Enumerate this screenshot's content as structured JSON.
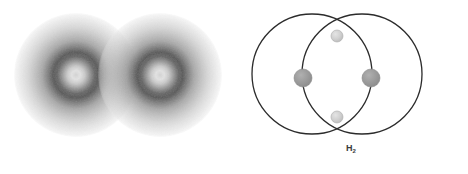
{
  "figure": {
    "width": 468,
    "height": 174,
    "background_color": "#ffffff",
    "caption_label": "H",
    "caption_subscript": "2",
    "caption_full": "H2"
  },
  "panels": [
    {
      "id": "electron-density",
      "name": "electron-density-cloud-panel",
      "description": "Two overlapping spherical electron density clouds",
      "rendering": "grayscale radial density",
      "atoms": [
        {
          "label": "H",
          "center_x": 76,
          "center_y": 75,
          "radius": 62
        },
        {
          "label": "H",
          "center_x": 160,
          "center_y": 75,
          "radius": 62
        }
      ],
      "colors": {
        "core_light": "#d8d8d8",
        "ring_dark": "#3c3c3c",
        "mid": "#8e8e8e",
        "outer_fade": "#e6e6e6"
      }
    },
    {
      "id": "orbital-schematic",
      "name": "orbital-overlap-schematic-panel",
      "description": "Two overlapping circles with nuclei and shared electrons at intersections",
      "circles": [
        {
          "label": "H",
          "center_x": 78,
          "center_y": 74,
          "radius": 60
        },
        {
          "label": "H",
          "center_x": 128,
          "center_y": 74,
          "radius": 60
        }
      ],
      "nuclei": [
        {
          "name": "nucleus-left",
          "cx": 69,
          "cy": 78,
          "r": 9
        },
        {
          "name": "nucleus-right",
          "cx": 137,
          "cy": 78,
          "r": 9
        }
      ],
      "electrons": [
        {
          "name": "shared-electron-top",
          "cx": 103,
          "cy": 36,
          "r": 6
        },
        {
          "name": "shared-electron-bottom",
          "cx": 103,
          "cy": 117,
          "r": 6
        }
      ],
      "colors": {
        "circle_stroke": "#2b2b2b",
        "nucleus_fill": "#9a9a9a",
        "nucleus_stroke": "#8a8a8a",
        "electron_fill": "#cfcfcf",
        "electron_stroke": "#b0b0b0"
      }
    }
  ]
}
